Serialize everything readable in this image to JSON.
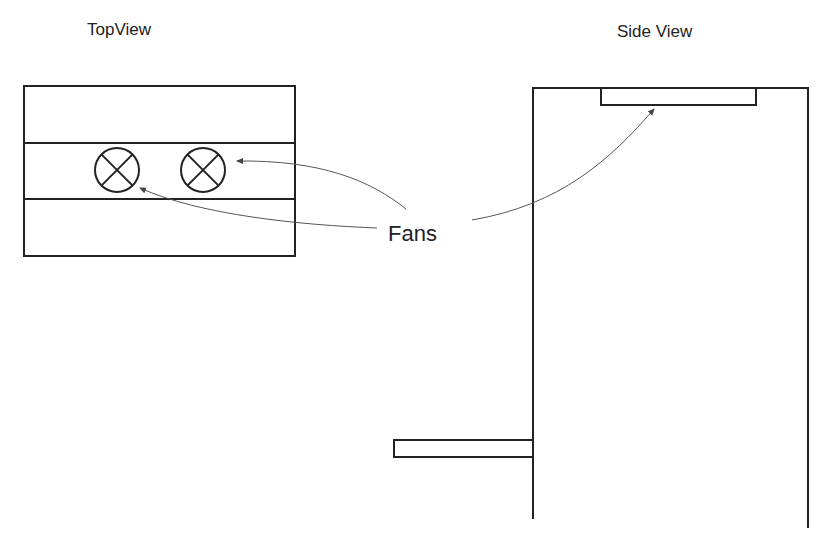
{
  "diagram": {
    "top_view": {
      "title": "TopView",
      "fan_count": 2
    },
    "side_view": {
      "title": "Side View"
    },
    "callout": {
      "label": "Fans",
      "targets": [
        "top-view-fan-1",
        "top-view-fan-2",
        "side-view-ceiling-fan"
      ]
    },
    "colors": {
      "stroke": "#222222",
      "arrow": "#555555",
      "background": "#ffffff"
    }
  }
}
